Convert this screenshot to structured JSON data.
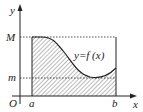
{
  "diagram": {
    "type": "function-area",
    "labels": {
      "y_axis": "y",
      "x_axis": "x",
      "origin": "O",
      "max": "M",
      "min": "m",
      "left_bound": "a",
      "right_bound": "b",
      "function": "y=f (x)"
    },
    "colors": {
      "stroke": "#222222",
      "hatch": "#555555",
      "background": "#ffffff"
    }
  }
}
